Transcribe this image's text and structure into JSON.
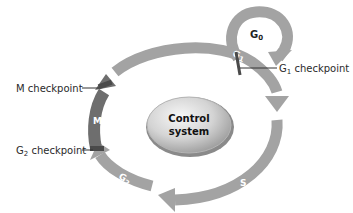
{
  "diagram": {
    "center": {
      "line1": "Control",
      "line2": "system"
    },
    "phases": {
      "g0": "G",
      "g0_sub": "0",
      "g1": "G",
      "g1_sub": "1",
      "s": "S",
      "g2": "G",
      "g2_sub": "2",
      "m": "M"
    },
    "checkpoints": {
      "m": "M checkpoint",
      "g1_prefix": "G",
      "g1_sub": "1",
      "g1_suffix": " checkpoint",
      "g2_prefix": "G",
      "g2_sub": "2",
      "g2_suffix": " checkpoint"
    },
    "colors": {
      "arc_gray": "#a3a3a3",
      "arc_dark": "#6e6e6e",
      "checkpoint_bar": "#4a4a4a",
      "center_light": "#f2f2f2",
      "center_dark": "#a8a8a8"
    }
  }
}
